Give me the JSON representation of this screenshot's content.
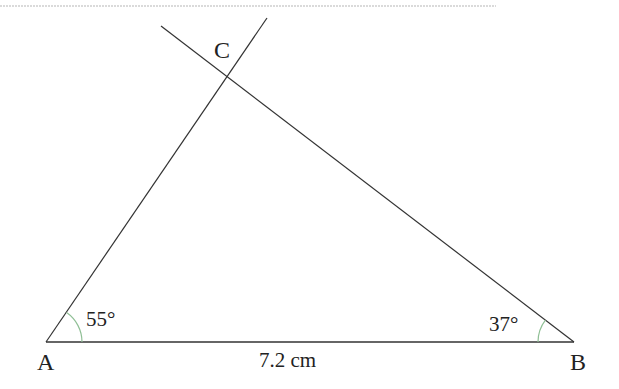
{
  "diagram": {
    "type": "triangle-construction",
    "vertices": {
      "A": {
        "label": "A",
        "x": 46,
        "y": 342
      },
      "B": {
        "label": "B",
        "x": 574,
        "y": 342
      },
      "C": {
        "label": "C",
        "x": 229,
        "y": 73
      }
    },
    "angles": {
      "A": {
        "label": "55°"
      },
      "B": {
        "label": "37°"
      }
    },
    "side_AB": {
      "label": "7.2 cm"
    },
    "colors": {
      "line": "#333333",
      "arc": "#8fbf95",
      "rule": "#b5b5b5"
    }
  }
}
